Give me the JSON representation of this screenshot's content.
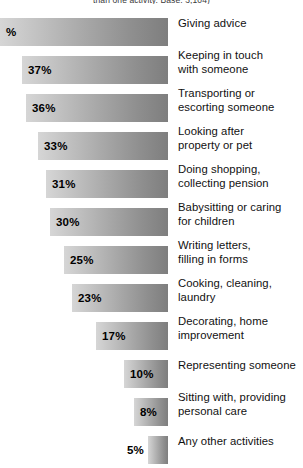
{
  "caption": "than one activity. Base: 3,104)",
  "axis": {
    "bar_right_edge_px": 168,
    "scale_note": "bars right-aligned; length proportional to percent"
  },
  "colors": {
    "bar_gradient_start": "#d6d6d6",
    "bar_gradient_end": "#7e7e7e",
    "label_text": "#111111",
    "value_text": "#000000",
    "background": "#ffffff"
  },
  "chart_data": {
    "type": "bar",
    "orientation": "horizontal",
    "title": "",
    "subtitle": "than one activity. Base: 3,104)",
    "xlabel": "",
    "ylabel": "",
    "xlim": [
      0,
      44
    ],
    "grid": false,
    "legend": null,
    "categories": [
      "Giving advice",
      "Keeping in touch with someone",
      "Transporting or escorting someone",
      "Looking after property or pet",
      "Doing shopping, collecting pension",
      "Babysitting or caring for children",
      "Writing letters, filling in forms",
      "Cooking, cleaning, laundry",
      "Decorating, home improvement",
      "Representing someone",
      "Sitting with, providing personal care",
      "Any other activities"
    ],
    "values": [
      44,
      37,
      36,
      33,
      31,
      30,
      25,
      23,
      17,
      10,
      8,
      5
    ],
    "value_labels": [
      "%",
      "37%",
      "36%",
      "33%",
      "31%",
      "30%",
      "25%",
      "23%",
      "17%",
      "10%",
      "8%",
      "5%"
    ]
  },
  "rows": [
    {
      "value_label": "%",
      "label_line1": "Giving advice",
      "label_line2": "",
      "bar_left": 0,
      "bar_width": 168,
      "value_pos": "inside",
      "clipped": true
    },
    {
      "value_label": "37%",
      "label_line1": "Keeping in touch",
      "label_line2": "with someone",
      "bar_left": 22,
      "bar_width": 146,
      "value_pos": "inside",
      "clipped": false
    },
    {
      "value_label": "36%",
      "label_line1": "Transporting or",
      "label_line2": "escorting someone",
      "bar_left": 26,
      "bar_width": 142,
      "value_pos": "inside",
      "clipped": false
    },
    {
      "value_label": "33%",
      "label_line1": "Looking after",
      "label_line2": "property or pet",
      "bar_left": 38,
      "bar_width": 130,
      "value_pos": "inside",
      "clipped": false
    },
    {
      "value_label": "31%",
      "label_line1": "Doing shopping,",
      "label_line2": "collecting pension",
      "bar_left": 46,
      "bar_width": 122,
      "value_pos": "inside",
      "clipped": false
    },
    {
      "value_label": "30%",
      "label_line1": "Babysitting or caring",
      "label_line2": "for children",
      "bar_left": 50,
      "bar_width": 118,
      "value_pos": "inside",
      "clipped": false
    },
    {
      "value_label": "25%",
      "label_line1": "Writing letters,",
      "label_line2": "filling in forms",
      "bar_left": 64,
      "bar_width": 104,
      "value_pos": "inside",
      "clipped": false
    },
    {
      "value_label": "23%",
      "label_line1": "Cooking, cleaning,",
      "label_line2": "laundry",
      "bar_left": 72,
      "bar_width": 96,
      "value_pos": "inside",
      "clipped": false
    },
    {
      "value_label": "17%",
      "label_line1": "Decorating, home",
      "label_line2": "improvement",
      "bar_left": 96,
      "bar_width": 72,
      "value_pos": "inside",
      "clipped": false
    },
    {
      "value_label": "10%",
      "label_line1": "Representing someone",
      "label_line2": "",
      "bar_left": 124,
      "bar_width": 44,
      "value_pos": "inside",
      "clipped": false
    },
    {
      "value_label": "8%",
      "label_line1": "Sitting with, providing",
      "label_line2": "personal care",
      "bar_left": 134,
      "bar_width": 34,
      "value_pos": "inside",
      "clipped": false
    },
    {
      "value_label": "5%",
      "label_line1": "Any other activities",
      "label_line2": "",
      "bar_left": 148,
      "bar_width": 20,
      "value_pos": "outside",
      "clipped": false
    }
  ]
}
